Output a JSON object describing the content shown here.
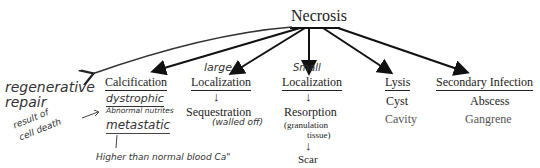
{
  "diagram": {
    "root": "Necrosis",
    "branches": [
      {
        "label": "Calcification",
        "annotation_above": "",
        "children": [
          "dystrophic",
          "metastatic"
        ]
      },
      {
        "label": "Localization",
        "annotation_above": "large",
        "children": [
          "Sequestration"
        ],
        "child_note": "(walled off)"
      },
      {
        "label": "Localization",
        "annotation_above": "Small",
        "children": [
          "Resorption",
          "Scar"
        ],
        "child_note": "(granulation tissue)"
      },
      {
        "label": "Lysis",
        "children": [
          "Cyst",
          "Cavity"
        ]
      },
      {
        "label": "Secondary Infection",
        "children": [
          "Abscess",
          "Gangrene"
        ]
      }
    ],
    "handwritten": {
      "regenerative_repair": [
        "regenerative",
        "repair"
      ],
      "dystrophic": "dystrophic",
      "dystrophic_note": "Abnormal nutrites",
      "metastatic": "metastatic",
      "metastatic_note": "Higher than normal blood Ca\"",
      "result_note": [
        "result of",
        "cell death"
      ],
      "large": "large",
      "small": "Small",
      "walled_off": "(walled off)"
    },
    "printed": {
      "calcification": "Calcification",
      "localization_large": "Localization",
      "sequestration": "Sequestration",
      "localization_small": "Localization",
      "resorption": "Resorption",
      "granulation_1": "(granulation",
      "granulation_2": "tissue)",
      "scar": "Scar",
      "lysis": "Lysis",
      "cyst": "Cyst",
      "cavity": "Cavity",
      "secondary_infection": "Secondary Infection",
      "abscess": "Abscess",
      "gangrene": "Gangrene"
    },
    "arrow_down": "↓"
  }
}
